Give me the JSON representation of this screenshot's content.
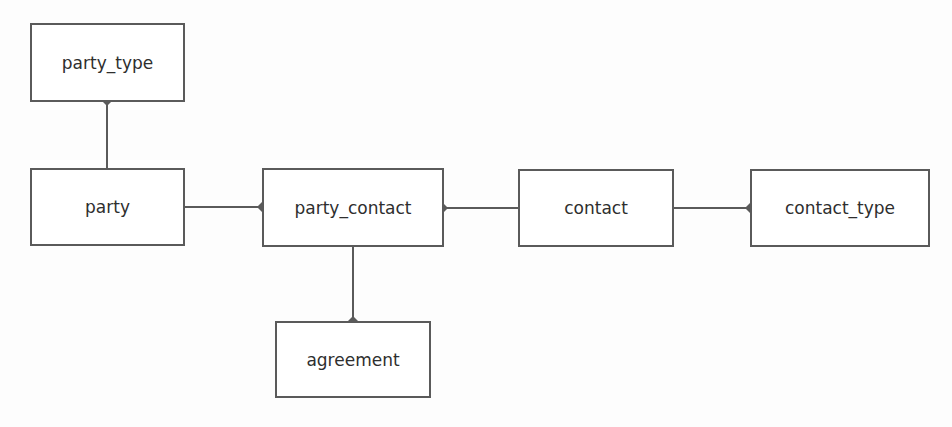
{
  "diagram": {
    "type": "entity-relationship",
    "colors": {
      "line": "#5a5a5a",
      "text": "#2e2e2e",
      "box_fill": "#ffffff",
      "background": "#fdfdfd"
    },
    "entities": [
      {
        "id": "party_type",
        "label": "party_type",
        "x": 30,
        "y": 23,
        "w": 155,
        "h": 79
      },
      {
        "id": "party",
        "label": "party",
        "x": 30,
        "y": 168,
        "w": 155,
        "h": 78
      },
      {
        "id": "party_contact",
        "label": "party_contact",
        "x": 262,
        "y": 168,
        "w": 182,
        "h": 79
      },
      {
        "id": "contact",
        "label": "contact",
        "x": 518,
        "y": 169,
        "w": 156,
        "h": 78
      },
      {
        "id": "contact_type",
        "label": "contact_type",
        "x": 750,
        "y": 169,
        "w": 180,
        "h": 78
      },
      {
        "id": "agreement",
        "label": "agreement",
        "x": 275,
        "y": 321,
        "w": 156,
        "h": 77
      }
    ],
    "relationships": [
      {
        "from": "party",
        "to": "party_type",
        "diamond_at": "party_type"
      },
      {
        "from": "party",
        "to": "party_contact",
        "diamond_at": "party_contact"
      },
      {
        "from": "contact",
        "to": "party_contact",
        "diamond_at": "party_contact"
      },
      {
        "from": "contact",
        "to": "contact_type",
        "diamond_at": "contact_type"
      },
      {
        "from": "party_contact",
        "to": "agreement",
        "diamond_at": "agreement"
      }
    ]
  }
}
